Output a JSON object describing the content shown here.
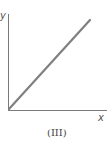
{
  "diagram": {
    "y_axis_label": "y",
    "x_axis_label": "x",
    "caption": "(III)",
    "line_description": "straight line through origin with positive slope",
    "colors": {
      "axis": "#777777",
      "line": "#7a7a7a",
      "background": "#ffffff"
    }
  }
}
